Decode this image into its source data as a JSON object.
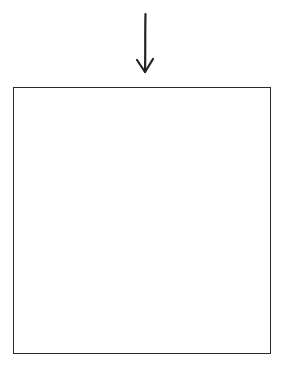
{
  "diagram": {
    "arrow": {
      "direction": "down",
      "icon": "down-arrow-icon",
      "stroke_color": "#222222"
    },
    "box": {
      "label": "",
      "border_color": "#2a2a2a",
      "fill_color": "#ffffff"
    }
  }
}
